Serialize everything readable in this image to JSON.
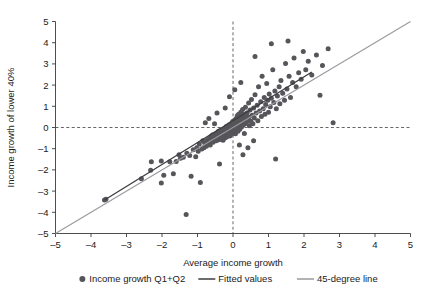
{
  "chart_data": {
    "type": "scatter",
    "title": "",
    "xlabel": "Average income growth",
    "ylabel": "Income growth of lower 40%",
    "xlim": [
      -5,
      5
    ],
    "ylim": [
      -5,
      5
    ],
    "xticks": [
      "-5",
      "-4",
      "-3",
      "-2",
      "-1",
      "0",
      "1",
      "2",
      "3",
      "4",
      "5"
    ],
    "yticks": [
      "5",
      "4",
      "3",
      "2",
      "1",
      "0",
      "-1",
      "-2",
      "-3",
      "-4",
      "-5"
    ],
    "xtick_values": [
      -5,
      -4,
      -3,
      -2,
      -1,
      0,
      1,
      2,
      3,
      4,
      5
    ],
    "ytick_values": [
      5,
      4,
      3,
      2,
      1,
      0,
      -1,
      -2,
      -3,
      -4,
      -5
    ],
    "grid": false,
    "reference_lines": {
      "horizontal_zero": 0,
      "vertical_zero": 0,
      "style": "dashed"
    },
    "legend_position": "below-axis",
    "legend": [
      {
        "label": "Income growth Q1+Q2",
        "marker": "circle",
        "color": "#55555a"
      },
      {
        "label": "Fitted values",
        "marker": "line",
        "color": "#3c3c42"
      },
      {
        "label": "45-degree line",
        "marker": "line",
        "color": "#9a9a9e"
      }
    ],
    "series": [
      {
        "name": "Income growth Q1+Q2",
        "marker": "circle",
        "color": "#55555a",
        "points": [
          [
            -3.62,
            -3.42
          ],
          [
            -3.58,
            -3.38
          ],
          [
            -2.32,
            -2.02
          ],
          [
            -2.3,
            -1.62
          ],
          [
            -2.02,
            -1.58
          ],
          [
            -1.95,
            -2.25
          ],
          [
            -1.78,
            -1.62
          ],
          [
            -1.6,
            -1.6
          ],
          [
            -1.52,
            -1.28
          ],
          [
            -1.48,
            -1.45
          ],
          [
            -1.4,
            -1.4
          ],
          [
            -1.32,
            -4.1
          ],
          [
            -1.3,
            -1.22
          ],
          [
            -1.22,
            -1.32
          ],
          [
            -1.18,
            -2.3
          ],
          [
            -1.12,
            -1.05
          ],
          [
            -1.05,
            -1.38
          ],
          [
            -1.02,
            -0.95
          ],
          [
            -0.98,
            -1.12
          ],
          [
            -0.95,
            -0.78
          ],
          [
            -0.92,
            -2.6
          ],
          [
            -0.88,
            -1.02
          ],
          [
            -0.85,
            -0.62
          ],
          [
            -0.82,
            -0.95
          ],
          [
            -0.8,
            -0.72
          ],
          [
            -0.78,
            0.22
          ],
          [
            -0.75,
            -0.88
          ],
          [
            -0.72,
            -0.58
          ],
          [
            -0.7,
            -0.68
          ],
          [
            -0.68,
            0.42
          ],
          [
            -0.66,
            -0.52
          ],
          [
            -0.64,
            -0.82
          ],
          [
            -0.62,
            -0.42
          ],
          [
            -0.6,
            -0.62
          ],
          [
            -0.58,
            -0.35
          ],
          [
            -0.56,
            -0.7
          ],
          [
            -0.54,
            -0.48
          ],
          [
            -0.52,
            0.18
          ],
          [
            -0.5,
            -0.55
          ],
          [
            -0.48,
            -0.3
          ],
          [
            -0.47,
            -0.62
          ],
          [
            -0.46,
            -0.4
          ],
          [
            -0.45,
            0.68
          ],
          [
            -0.44,
            -0.25
          ],
          [
            -0.43,
            -0.52
          ],
          [
            -0.42,
            -0.45
          ],
          [
            -0.41,
            -0.18
          ],
          [
            -0.4,
            -0.58
          ],
          [
            -0.39,
            -0.35
          ],
          [
            -0.38,
            -1.72
          ],
          [
            -0.37,
            -0.22
          ],
          [
            -0.36,
            -0.48
          ],
          [
            -0.35,
            -0.42
          ],
          [
            -0.34,
            -0.12
          ],
          [
            -0.33,
            -0.55
          ],
          [
            -0.32,
            -0.28
          ],
          [
            -0.31,
            -0.38
          ],
          [
            -0.3,
            -0.45
          ],
          [
            -0.29,
            -0.18
          ],
          [
            -0.28,
            -0.6
          ],
          [
            -0.27,
            -0.32
          ],
          [
            -0.26,
            -0.08
          ],
          [
            -0.25,
            -0.42
          ],
          [
            -0.24,
            -0.25
          ],
          [
            -0.23,
            -0.5
          ],
          [
            -0.22,
            -0.15
          ],
          [
            -0.21,
            -0.35
          ],
          [
            -0.2,
            -0.28
          ],
          [
            -0.19,
            0.05
          ],
          [
            -0.18,
            -0.45
          ],
          [
            -0.17,
            -0.2
          ],
          [
            -0.16,
            -0.32
          ],
          [
            -0.15,
            -0.1
          ],
          [
            -0.14,
            -0.38
          ],
          [
            -0.13,
            -0.22
          ],
          [
            -0.12,
            0.12
          ],
          [
            -0.11,
            -0.3
          ],
          [
            -0.1,
            -0.15
          ],
          [
            -0.09,
            -0.4
          ],
          [
            -0.08,
            -0.05
          ],
          [
            -0.07,
            -0.25
          ],
          [
            -0.06,
            0.18
          ],
          [
            -0.05,
            -0.18
          ],
          [
            -0.04,
            -0.32
          ],
          [
            -0.03,
            0.02
          ],
          [
            -0.02,
            -0.12
          ],
          [
            -0.01,
            0.28
          ],
          [
            0.0,
            -0.22
          ],
          [
            0.01,
            0.08
          ],
          [
            0.02,
            -0.08
          ],
          [
            0.03,
            0.22
          ],
          [
            0.04,
            -0.15
          ],
          [
            0.05,
            0.35
          ],
          [
            0.06,
            0.0
          ],
          [
            0.07,
            -0.3
          ],
          [
            0.08,
            0.15
          ],
          [
            0.09,
            0.42
          ],
          [
            0.1,
            -0.05
          ],
          [
            0.11,
            0.25
          ],
          [
            0.12,
            0.55
          ],
          [
            0.13,
            0.1
          ],
          [
            0.14,
            -0.18
          ],
          [
            0.15,
            0.32
          ],
          [
            0.16,
            0.62
          ],
          [
            0.17,
            0.05
          ],
          [
            0.18,
            0.38
          ],
          [
            0.19,
            -0.08
          ],
          [
            0.2,
            0.48
          ],
          [
            0.21,
            0.18
          ],
          [
            0.22,
            0.72
          ],
          [
            0.23,
            0.28
          ],
          [
            0.24,
            0.02
          ],
          [
            0.25,
            0.52
          ],
          [
            0.26,
            0.22
          ],
          [
            0.27,
            0.85
          ],
          [
            0.28,
            0.38
          ],
          [
            0.29,
            0.12
          ],
          [
            0.3,
            0.62
          ],
          [
            0.31,
            0.3
          ],
          [
            0.32,
            -0.28
          ],
          [
            0.33,
            0.45
          ],
          [
            0.34,
            0.18
          ],
          [
            0.35,
            0.95
          ],
          [
            0.36,
            0.52
          ],
          [
            0.38,
            0.25
          ],
          [
            0.4,
            0.7
          ],
          [
            0.42,
            0.35
          ],
          [
            0.44,
            1.15
          ],
          [
            0.45,
            0.48
          ],
          [
            0.46,
            0.08
          ],
          [
            0.48,
            0.82
          ],
          [
            0.5,
            0.3
          ],
          [
            0.52,
            1.32
          ],
          [
            0.54,
            0.58
          ],
          [
            0.56,
            0.18
          ],
          [
            0.58,
            0.92
          ],
          [
            0.6,
            0.45
          ],
          [
            0.62,
            1.55
          ],
          [
            0.65,
            0.68
          ],
          [
            0.68,
            1.05
          ],
          [
            0.7,
            0.32
          ],
          [
            0.72,
            1.92
          ],
          [
            0.75,
            0.78
          ],
          [
            0.78,
            1.22
          ],
          [
            0.8,
            0.52
          ],
          [
            0.82,
            2.42
          ],
          [
            0.85,
            0.88
          ],
          [
            0.88,
            1.42
          ],
          [
            0.9,
            0.62
          ],
          [
            0.92,
            1.08
          ],
          [
            0.95,
            2.08
          ],
          [
            0.98,
            1.28
          ],
          [
            1.0,
            0.72
          ],
          [
            1.02,
            1.58
          ],
          [
            1.05,
            0.98
          ],
          [
            1.08,
            1.38
          ],
          [
            1.12,
            2.72
          ],
          [
            1.15,
            1.18
          ],
          [
            1.18,
            1.72
          ],
          [
            1.2,
            -1.48
          ],
          [
            1.22,
            0.88
          ],
          [
            1.25,
            1.48
          ],
          [
            1.3,
            1.92
          ],
          [
            1.32,
            1.12
          ],
          [
            1.35,
            2.22
          ],
          [
            1.4,
            1.62
          ],
          [
            1.45,
            1.28
          ],
          [
            1.48,
            3.02
          ],
          [
            1.52,
            1.82
          ],
          [
            1.58,
            2.42
          ],
          [
            1.62,
            1.42
          ],
          [
            1.68,
            2.12
          ],
          [
            1.72,
            3.28
          ],
          [
            1.78,
            1.92
          ],
          [
            1.85,
            2.58
          ],
          [
            1.92,
            2.28
          ],
          [
            1.98,
            3.58
          ],
          [
            2.05,
            2.72
          ],
          [
            2.12,
            3.12
          ],
          [
            2.22,
            2.48
          ],
          [
            2.35,
            3.42
          ],
          [
            2.45,
            1.52
          ],
          [
            2.52,
            2.92
          ],
          [
            2.68,
            3.72
          ],
          [
            2.82,
            0.22
          ],
          [
            0.58,
            -0.62
          ],
          [
            0.42,
            -0.95
          ],
          [
            0.28,
            -1.28
          ],
          [
            -0.1,
            1.45
          ],
          [
            0.05,
            1.78
          ],
          [
            0.22,
            2.12
          ],
          [
            -0.22,
            0.92
          ],
          [
            0.62,
            3.35
          ],
          [
            1.08,
            3.95
          ],
          [
            1.55,
            4.08
          ],
          [
            -2.58,
            -2.42
          ],
          [
            -2.02,
            -2.62
          ],
          [
            -1.68,
            -2.18
          ],
          [
            0.18,
            -0.82
          ]
        ]
      }
    ],
    "lines": [
      {
        "name": "Fitted values",
        "color": "#3c3c42",
        "x_start": -3.62,
        "y_start": -3.42,
        "x_end": 2.22,
        "y_end": 2.62
      },
      {
        "name": "45-degree line",
        "color": "#9a9a9e",
        "x_start": -5,
        "y_start": -5,
        "x_end": 5,
        "y_end": 5
      }
    ]
  }
}
